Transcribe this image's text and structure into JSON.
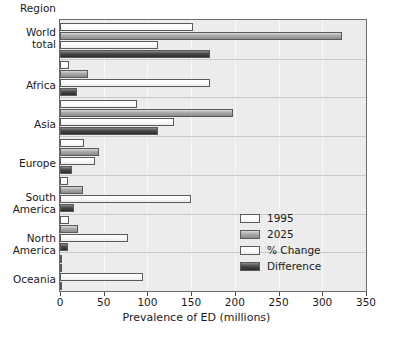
{
  "axis": {
    "region_header": "Region",
    "xlabel": "Prevalence of ED (millions)",
    "xticks": [
      "0",
      "50",
      "100",
      "150",
      "200",
      "250",
      "300",
      "350"
    ]
  },
  "legend": {
    "items": [
      {
        "label": "1995",
        "color": "#ffffff"
      },
      {
        "label": "2025",
        "color": "#a9a9a9"
      },
      {
        "label": "% Change",
        "color": "#fbfbfb"
      },
      {
        "label": "Difference",
        "color": "#3c3c3c"
      }
    ]
  },
  "categories": [
    {
      "label": "World\ntotal",
      "line1": "World",
      "line2": "total"
    },
    {
      "label": "Africa",
      "line1": "Africa",
      "line2": ""
    },
    {
      "label": "Asia",
      "line1": "Asia",
      "line2": ""
    },
    {
      "label": "Europe",
      "line1": "Europe",
      "line2": ""
    },
    {
      "label": "South\nAmerica",
      "line1": "South",
      "line2": "America"
    },
    {
      "label": "North\nAmerica",
      "line1": "North",
      "line2": "America"
    },
    {
      "label": "Oceania",
      "line1": "Oceania",
      "line2": ""
    }
  ],
  "chart_data": {
    "type": "bar",
    "orientation": "horizontal",
    "title": "",
    "xlabel": "Prevalence of ED (millions)",
    "ylabel": "Region",
    "xlim": [
      0,
      350
    ],
    "xticks": [
      0,
      50,
      100,
      150,
      200,
      250,
      300,
      350
    ],
    "grid": true,
    "legend_position": "inside-right",
    "categories": [
      "World total",
      "Africa",
      "Asia",
      "Europe",
      "South America",
      "North America",
      "Oceania"
    ],
    "series": [
      {
        "name": "1995",
        "values": [
          152,
          10,
          88,
          28,
          9,
          10,
          1
        ]
      },
      {
        "name": "2025",
        "values": [
          322,
          32,
          198,
          45,
          26,
          21,
          2
        ]
      },
      {
        "name": "% Change",
        "values": [
          112,
          172,
          130,
          40,
          150,
          78,
          95
        ]
      },
      {
        "name": "Difference",
        "values": [
          172,
          20,
          112,
          14,
          16,
          9,
          1
        ]
      }
    ]
  }
}
